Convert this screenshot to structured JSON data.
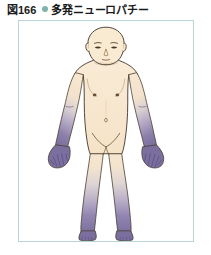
{
  "caption": {
    "number": "図166",
    "bullet_icon": "bullet-dot-icon",
    "bullet_color": "#7fb3ab",
    "title": "多発ニューロパチー",
    "text_color": "#1a1a1a"
  },
  "figure": {
    "name": "polyneuropathy-body-diagram",
    "frame_border_color": "#b9d4d4",
    "background_color": "#ffffff",
    "skin_color": "#f7e7cf",
    "skin_shadow_color": "#efd9ba",
    "outline_color": "#3c3226",
    "affected_color_dark": "#7b6f9f",
    "affected_color_mid": "#9a90ba",
    "affected_color_light": "#c6c0d8",
    "regions": [
      {
        "name": "left-hand-glove-distribution",
        "label": "glove distribution",
        "color": "#7b6f9f"
      },
      {
        "name": "right-hand-glove-distribution",
        "label": "glove distribution",
        "color": "#7b6f9f"
      },
      {
        "name": "left-foot-stocking-distribution",
        "label": "stocking distribution",
        "color": "#7b6f9f"
      },
      {
        "name": "right-foot-stocking-distribution",
        "label": "stocking distribution",
        "color": "#7b6f9f"
      }
    ]
  }
}
